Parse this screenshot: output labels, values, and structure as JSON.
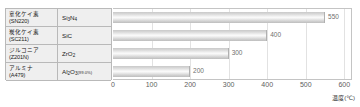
{
  "chart_data": {
    "type": "bar",
    "orientation": "horizontal",
    "title": "",
    "xlabel": "温度(℃)",
    "ylabel": "",
    "xlim": [
      0,
      620
    ],
    "xticks": [
      0,
      100,
      200,
      300,
      400,
      500,
      600
    ],
    "xtick_labels": [
      "0",
      "100",
      "200",
      "300",
      "400",
      "500",
      "600"
    ],
    "grid": true,
    "legend": "none",
    "categories": [
      "Si3N4",
      "SiC",
      "ZrO2",
      "Al2O3"
    ],
    "values": [
      550,
      400,
      300,
      200
    ],
    "value_labels": [
      "550",
      "400",
      "300",
      "200"
    ]
  },
  "table": {
    "rows": [
      {
        "name_line1": "窒化ケイ素",
        "name_line2": "(SN220)",
        "formula_main": "Si",
        "formula_sub1": "3",
        "formula_mid": "N",
        "formula_sub2": "4",
        "formula_suffix": "",
        "value": "550"
      },
      {
        "name_line1": "炭化ケイ素",
        "name_line2": "(SC211)",
        "formula_main": "Si",
        "formula_sub1": "",
        "formula_mid": "C",
        "formula_sub2": "",
        "formula_suffix": "",
        "value": "400"
      },
      {
        "name_line1": "ジルコニア",
        "name_line2": "(Z201N)",
        "formula_main": "Zr",
        "formula_sub1": "",
        "formula_mid": "O",
        "formula_sub2": "2",
        "formula_suffix": "",
        "value": "300"
      },
      {
        "name_line1": "アルミナ",
        "name_line2": "(A479)",
        "formula_main": "Al",
        "formula_sub1": "2",
        "formula_mid": "O",
        "formula_sub2": "3",
        "formula_suffix": "(99.0%)",
        "value": "200"
      }
    ]
  },
  "colors": {
    "bar_light": "#fbfbfb",
    "bar_dark": "#bdbdbd",
    "border": "#b9b9b9",
    "header_bg": "#efefef",
    "grid": "#e2e2e2",
    "text": "#1a1a1a",
    "value_text": "#6f6f6f"
  }
}
